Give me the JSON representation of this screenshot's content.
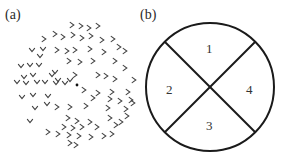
{
  "panel_a": {
    "label": "(a)",
    "center_dot": {
      "x": 77,
      "y": 85
    },
    "chevrons_right": [
      [
        72,
        25
      ],
      [
        81,
        26
      ],
      [
        89,
        28
      ],
      [
        98,
        26
      ],
      [
        55,
        34
      ],
      [
        63,
        37
      ],
      [
        73,
        35
      ],
      [
        82,
        38
      ],
      [
        91,
        36
      ],
      [
        102,
        40
      ],
      [
        113,
        39
      ],
      [
        44,
        39
      ],
      [
        57,
        50
      ],
      [
        67,
        51
      ],
      [
        75,
        50
      ],
      [
        90,
        49
      ],
      [
        104,
        52
      ],
      [
        119,
        47
      ],
      [
        125,
        51
      ],
      [
        69,
        61
      ],
      [
        80,
        62
      ],
      [
        93,
        61
      ],
      [
        115,
        61
      ],
      [
        125,
        68
      ],
      [
        75,
        75
      ],
      [
        98,
        75
      ],
      [
        106,
        76
      ],
      [
        115,
        79
      ],
      [
        134,
        80
      ],
      [
        84,
        90
      ],
      [
        98,
        93
      ],
      [
        112,
        92
      ],
      [
        128,
        92
      ],
      [
        131,
        100
      ],
      [
        93,
        98
      ],
      [
        110,
        99
      ],
      [
        120,
        101
      ],
      [
        133,
        103
      ],
      [
        57,
        107
      ],
      [
        70,
        107
      ],
      [
        86,
        106
      ],
      [
        108,
        108
      ],
      [
        126,
        109
      ],
      [
        68,
        118
      ],
      [
        77,
        121
      ],
      [
        90,
        122
      ],
      [
        110,
        118
      ],
      [
        127,
        116
      ],
      [
        121,
        122
      ],
      [
        64,
        127
      ],
      [
        73,
        128
      ],
      [
        82,
        127
      ],
      [
        97,
        127
      ],
      [
        116,
        125
      ],
      [
        48,
        132
      ],
      [
        58,
        134
      ],
      [
        69,
        135
      ],
      [
        79,
        136
      ],
      [
        91,
        137
      ],
      [
        104,
        136
      ],
      [
        112,
        134
      ],
      [
        70,
        143
      ],
      [
        76,
        145
      ]
    ],
    "chevrons_down": [
      [
        32,
        50
      ],
      [
        43,
        49
      ],
      [
        40,
        56
      ],
      [
        21,
        66
      ],
      [
        30,
        65
      ],
      [
        39,
        65
      ],
      [
        55,
        72
      ],
      [
        24,
        77
      ],
      [
        33,
        75
      ],
      [
        52,
        75
      ],
      [
        58,
        80
      ],
      [
        17,
        82
      ],
      [
        26,
        83
      ],
      [
        37,
        82
      ],
      [
        45,
        82
      ],
      [
        56,
        83
      ],
      [
        65,
        83
      ],
      [
        70,
        80
      ],
      [
        22,
        97
      ],
      [
        33,
        95
      ],
      [
        48,
        96
      ],
      [
        35,
        108
      ],
      [
        47,
        104
      ],
      [
        30,
        121
      ]
    ]
  },
  "panel_b": {
    "label": "(b)",
    "circle": {
      "cx": 210,
      "cy": 87,
      "r": 64
    },
    "quadrants": [
      {
        "id": "1",
        "label": "1"
      },
      {
        "id": "2",
        "label": "2"
      },
      {
        "id": "3",
        "label": "3"
      },
      {
        "id": "4",
        "label": "4"
      }
    ]
  },
  "colors": {
    "stroke": "#1a1a1a",
    "chevron": "#444444",
    "background": "#ffffff"
  }
}
